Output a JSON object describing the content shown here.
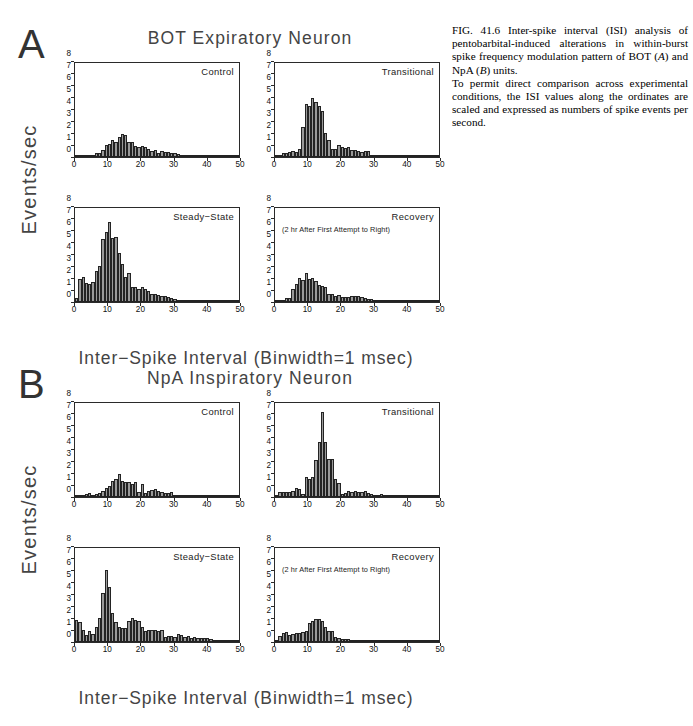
{
  "caption": {
    "lines": [
      "FIG. 41.6  Inter-spike interval (ISI) analysis of pentobarbital-induced alterations in within-burst spike frequency modulation pattern of BOT (A) and NpA (B) units.",
      "To permit direct comparison across experimental conditions, the ISI values along the ordinates are scaled and expressed as numbers of spike events per second."
    ],
    "label": "FIG. 41.6",
    "para1_pre": "FIG. 41.6  Inter-spike interval (ISI) analysis of pentobarbital-induced alterations in within-burst spike frequency modulation pattern of BOT (",
    "para1_italic_a": "A",
    "para1_mid": ") and NpA (",
    "para1_italic_b": "B",
    "para1_post": ") units.",
    "para2": "To permit direct comparison across experimental conditions, the ISI values along the ordinates are scaled and expressed as numbers of spike events per second."
  },
  "panels": [
    {
      "letter": "A",
      "title": "BOT Expiratory Neuron",
      "ylabel": "Events/sec",
      "xlabel": "Inter−Spike Interval (Binwidth=1 msec)"
    },
    {
      "letter": "B",
      "title": "NpA Inspiratory Neuron",
      "ylabel": "Events/sec",
      "xlabel": "Inter−Spike Interval (Binwidth=1 msec)"
    }
  ],
  "conditions": {
    "control": "Control",
    "transitional": "Transitional",
    "steady_state": "Steady−State",
    "recovery": "Recovery",
    "recovery_sub": "(2 hr After First Attempt to Right)"
  },
  "axis": {
    "yticks": [
      0,
      1,
      2,
      3,
      4,
      5,
      6,
      7,
      8
    ],
    "xticks": [
      0,
      10,
      20,
      30,
      40,
      50
    ],
    "ymax": 8,
    "xmin": 0,
    "xmax": 50
  },
  "colors": {
    "bar_fill": "#9a9a9a",
    "bar_edge": "#232323",
    "axis": "#2a2a2a",
    "text": "#444444"
  },
  "chart_data": [
    {
      "type": "bar",
      "id": "A-control",
      "panel": "A",
      "title": "Control",
      "xlabel": "Inter−Spike Interval (Binwidth=1 msec)",
      "ylabel": "Events/sec",
      "xlim": [
        0,
        50
      ],
      "ylim": [
        0,
        8
      ],
      "grid": false,
      "legend": false,
      "binwidth": 1,
      "x": [
        1,
        2,
        3,
        4,
        5,
        6,
        7,
        8,
        9,
        10,
        11,
        12,
        13,
        14,
        15,
        16,
        17,
        18,
        19,
        20,
        21,
        22,
        23,
        24,
        25,
        26,
        27,
        28,
        29,
        30,
        31,
        32,
        33,
        34,
        35,
        36,
        37,
        38,
        39,
        40,
        41,
        42,
        43,
        44,
        45,
        46,
        47,
        48,
        49,
        50
      ],
      "values": [
        0.02,
        0.05,
        0.12,
        0.18,
        0.18,
        0.2,
        0.3,
        0.38,
        0.62,
        1.05,
        1.1,
        1.45,
        1.3,
        1.7,
        1.95,
        1.9,
        1.3,
        1.25,
        0.95,
        0.88,
        0.9,
        0.85,
        0.7,
        0.55,
        0.62,
        0.35,
        0.5,
        0.45,
        0.4,
        0.38,
        0.3,
        0.22,
        0.18,
        0.14,
        0.12,
        0.1,
        0.09,
        0.08,
        0.07,
        0.06,
        0.06,
        0.05,
        0.05,
        0.04,
        0.04,
        0.03,
        0.03,
        0.03,
        0.02,
        0.02
      ]
    },
    {
      "type": "bar",
      "id": "A-transitional",
      "panel": "A",
      "title": "Transitional",
      "xlabel": "Inter−Spike Interval (Binwidth=1 msec)",
      "ylabel": "Events/sec",
      "xlim": [
        0,
        50
      ],
      "ylim": [
        0,
        8
      ],
      "grid": false,
      "legend": false,
      "binwidth": 1,
      "x": [
        1,
        2,
        3,
        4,
        5,
        6,
        7,
        8,
        9,
        10,
        11,
        12,
        13,
        14,
        15,
        16,
        17,
        18,
        19,
        20,
        21,
        22,
        23,
        24,
        25,
        26,
        27,
        28,
        29,
        30,
        31,
        32,
        33,
        34,
        35,
        36,
        37,
        38,
        39,
        40,
        41,
        42,
        43,
        44,
        45,
        46,
        47,
        48,
        49,
        50
      ],
      "values": [
        0.05,
        0.12,
        0.3,
        0.38,
        0.4,
        0.55,
        0.42,
        0.65,
        2.55,
        4.5,
        4.35,
        5.05,
        4.7,
        4.35,
        3.95,
        2.05,
        1.45,
        0.7,
        0.65,
        1.0,
        0.85,
        0.8,
        0.88,
        0.6,
        0.62,
        0.48,
        0.4,
        0.55,
        0.52,
        0.18,
        0.15,
        0.12,
        0.1,
        0.09,
        0.08,
        0.12,
        0.08,
        0.07,
        0.07,
        0.06,
        0.1,
        0.06,
        0.05,
        0.05,
        0.05,
        0.04,
        0.04,
        0.03,
        0.03,
        0.03
      ]
    },
    {
      "type": "bar",
      "id": "A-steady-state",
      "panel": "A",
      "title": "Steady−State",
      "xlabel": "Inter−Spike Interval (Binwidth=1 msec)",
      "ylabel": "Events/sec",
      "xlim": [
        0,
        50
      ],
      "ylim": [
        0,
        8
      ],
      "grid": false,
      "legend": false,
      "binwidth": 1,
      "x": [
        1,
        2,
        3,
        4,
        5,
        6,
        7,
        8,
        9,
        10,
        11,
        12,
        13,
        14,
        15,
        16,
        17,
        18,
        19,
        20,
        21,
        22,
        23,
        24,
        25,
        26,
        27,
        28,
        29,
        30,
        31,
        32,
        33,
        34,
        35,
        36,
        37,
        38,
        39,
        40,
        41,
        42,
        43,
        44,
        45,
        46,
        47,
        48,
        49,
        50
      ],
      "values": [
        0.3,
        2.0,
        2.1,
        1.6,
        1.55,
        1.7,
        2.6,
        3.05,
        5.35,
        6.0,
        6.85,
        5.45,
        5.5,
        4.15,
        3.25,
        2.15,
        2.5,
        1.25,
        1.3,
        1.15,
        1.3,
        1.15,
        0.95,
        0.7,
        0.65,
        0.6,
        0.55,
        0.5,
        0.42,
        0.3,
        0.22,
        0.2,
        0.18,
        0.16,
        0.14,
        0.12,
        0.1,
        0.09,
        0.08,
        0.07,
        0.06,
        0.06,
        0.05,
        0.05,
        0.04,
        0.04,
        0.04,
        0.03,
        0.03,
        0.03
      ]
    },
    {
      "type": "bar",
      "id": "A-recovery",
      "panel": "A",
      "title": "Recovery",
      "subtitle": "(2 hr After First Attempt to Right)",
      "xlabel": "Inter−Spike Interval (Binwidth=1 msec)",
      "ylabel": "Events/sec",
      "xlim": [
        0,
        50
      ],
      "ylim": [
        0,
        8
      ],
      "grid": false,
      "legend": false,
      "binwidth": 1,
      "x": [
        1,
        2,
        3,
        4,
        5,
        6,
        7,
        8,
        9,
        10,
        11,
        12,
        13,
        14,
        15,
        16,
        17,
        18,
        19,
        20,
        21,
        22,
        23,
        24,
        25,
        26,
        27,
        28,
        29,
        30,
        31,
        32,
        33,
        34,
        35,
        36,
        37,
        38,
        39,
        40,
        41,
        42,
        43,
        44,
        45,
        46,
        47,
        48,
        49,
        50
      ],
      "values": [
        0.03,
        0.05,
        0.1,
        0.3,
        0.35,
        1.1,
        1.55,
        2.05,
        1.9,
        2.45,
        1.95,
        2.05,
        1.75,
        1.45,
        1.4,
        1.25,
        0.7,
        0.65,
        0.55,
        0.6,
        0.45,
        0.42,
        0.45,
        0.48,
        0.5,
        0.48,
        0.4,
        0.35,
        0.28,
        0.22,
        0.18,
        0.15,
        0.13,
        0.12,
        0.1,
        0.09,
        0.08,
        0.08,
        0.07,
        0.07,
        0.06,
        0.06,
        0.05,
        0.05,
        0.05,
        0.04,
        0.04,
        0.04,
        0.03,
        0.03
      ]
    },
    {
      "type": "bar",
      "id": "B-control",
      "panel": "B",
      "title": "Control",
      "xlabel": "Inter−Spike Interval (Binwidth=1 msec)",
      "ylabel": "Events/sec",
      "xlim": [
        0,
        50
      ],
      "ylim": [
        0,
        8
      ],
      "grid": false,
      "legend": false,
      "binwidth": 1,
      "x": [
        1,
        2,
        3,
        4,
        5,
        6,
        7,
        8,
        9,
        10,
        11,
        12,
        13,
        14,
        15,
        16,
        17,
        18,
        19,
        20,
        21,
        22,
        23,
        24,
        25,
        26,
        27,
        28,
        29,
        30,
        31,
        32,
        33,
        34,
        35,
        36,
        37,
        38,
        39,
        40,
        41,
        42,
        43,
        44,
        45,
        46,
        47,
        48,
        49,
        50
      ],
      "values": [
        0.1,
        0.15,
        0.18,
        0.22,
        0.3,
        0.2,
        0.28,
        0.38,
        0.55,
        0.75,
        0.9,
        1.35,
        1.5,
        2.0,
        1.35,
        1.3,
        1.25,
        1.15,
        1.25,
        0.45,
        1.15,
        0.3,
        0.55,
        0.6,
        0.65,
        0.5,
        0.45,
        0.35,
        0.3,
        0.4,
        0.18,
        0.15,
        0.12,
        0.12,
        0.1,
        0.15,
        0.12,
        0.1,
        0.08,
        0.12,
        0.08,
        0.07,
        0.06,
        0.1,
        0.06,
        0.05,
        0.05,
        0.05,
        0.08,
        0.05
      ]
    },
    {
      "type": "bar",
      "id": "B-transitional",
      "panel": "B",
      "title": "Transitional",
      "xlabel": "Inter−Spike Interval (Binwidth=1 msec)",
      "ylabel": "Events/sec",
      "xlim": [
        0,
        50
      ],
      "ylim": [
        0,
        8
      ],
      "grid": false,
      "legend": false,
      "binwidth": 1,
      "x": [
        1,
        2,
        3,
        4,
        5,
        6,
        7,
        8,
        9,
        10,
        11,
        12,
        13,
        14,
        15,
        16,
        17,
        18,
        19,
        20,
        21,
        22,
        23,
        24,
        25,
        26,
        27,
        28,
        29,
        30,
        31,
        32,
        33,
        34,
        35,
        36,
        37,
        38,
        39,
        40,
        41,
        42,
        43,
        44,
        45,
        46,
        47,
        48,
        49,
        50
      ],
      "values": [
        0.18,
        0.4,
        0.42,
        0.45,
        0.4,
        0.5,
        0.75,
        0.7,
        0.28,
        1.7,
        1.55,
        1.7,
        3.15,
        4.65,
        7.2,
        4.65,
        3.2,
        3.2,
        1.55,
        1.2,
        0.22,
        0.3,
        0.55,
        0.45,
        0.55,
        0.4,
        0.45,
        0.55,
        0.3,
        0.25,
        0.2,
        0.15,
        0.25,
        0.12,
        0.15,
        0.1,
        0.18,
        0.12,
        0.1,
        0.12,
        0.08,
        0.08,
        0.07,
        0.1,
        0.06,
        0.06,
        0.05,
        0.08,
        0.05,
        0.05
      ]
    },
    {
      "type": "bar",
      "id": "B-steady-state",
      "panel": "B",
      "title": "Steady−State",
      "xlabel": "Inter−Spike Interval (Binwidth=1 msec)",
      "ylabel": "Events/sec",
      "xlim": [
        0,
        50
      ],
      "ylim": [
        0,
        8
      ],
      "grid": false,
      "legend": false,
      "binwidth": 1,
      "x": [
        1,
        2,
        3,
        4,
        5,
        6,
        7,
        8,
        9,
        10,
        11,
        12,
        13,
        14,
        15,
        16,
        17,
        18,
        19,
        20,
        21,
        22,
        23,
        24,
        25,
        26,
        27,
        28,
        29,
        30,
        31,
        32,
        33,
        34,
        35,
        36,
        37,
        38,
        39,
        40,
        41,
        42,
        43,
        44,
        45,
        46,
        47,
        48,
        49,
        50
      ],
      "values": [
        1.9,
        1.7,
        1.0,
        0.6,
        0.95,
        0.7,
        1.25,
        2.05,
        4.15,
        6.15,
        4.65,
        2.45,
        1.7,
        1.25,
        1.2,
        1.2,
        1.75,
        2.05,
        1.85,
        1.8,
        1.25,
        0.9,
        1.05,
        1.05,
        1.0,
        0.95,
        1.0,
        0.45,
        0.55,
        0.5,
        0.45,
        0.7,
        0.6,
        0.45,
        0.5,
        0.35,
        0.45,
        0.35,
        0.3,
        0.35,
        0.3,
        0.25,
        0.2,
        0.18,
        0.15,
        0.15,
        0.12,
        0.12,
        0.1,
        0.1
      ]
    },
    {
      "type": "bar",
      "id": "B-recovery",
      "panel": "B",
      "title": "Recovery",
      "subtitle": "(2 hr After First Attempt to Right)",
      "xlabel": "Inter−Spike Interval (Binwidth=1 msec)",
      "ylabel": "Events/sec",
      "xlim": [
        0,
        50
      ],
      "ylim": [
        0,
        8
      ],
      "grid": false,
      "legend": false,
      "binwidth": 1,
      "x": [
        1,
        2,
        3,
        4,
        5,
        6,
        7,
        8,
        9,
        10,
        11,
        12,
        13,
        14,
        15,
        16,
        17,
        18,
        19,
        20,
        21,
        22,
        23,
        24,
        25,
        26,
        27,
        28,
        29,
        30,
        31,
        32,
        33,
        34,
        35,
        36,
        37,
        38,
        39,
        40,
        41,
        42,
        43,
        44,
        45,
        46,
        47,
        48,
        49,
        50
      ],
      "values": [
        0.2,
        0.55,
        0.8,
        0.85,
        0.6,
        0.7,
        0.75,
        0.75,
        0.85,
        0.9,
        1.6,
        1.75,
        1.95,
        2.0,
        1.75,
        1.3,
        0.95,
        0.9,
        0.45,
        0.3,
        0.28,
        0.25,
        0.22,
        0.18,
        0.15,
        0.18,
        0.14,
        0.15,
        0.12,
        0.12,
        0.1,
        0.09,
        0.08,
        0.08,
        0.07,
        0.07,
        0.06,
        0.06,
        0.05,
        0.05,
        0.05,
        0.04,
        0.04,
        0.04,
        0.03,
        0.03,
        0.03,
        0.03,
        0.02,
        0.02
      ]
    }
  ]
}
